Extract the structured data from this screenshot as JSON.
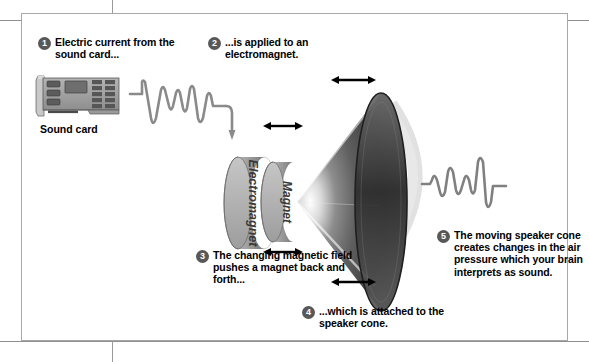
{
  "figure": {
    "frame_color": "#a8a8a8",
    "badge_color": "#585858",
    "wave_color": "#808080"
  },
  "callouts": [
    {
      "number": "1",
      "text": "Electric current from the sound card..."
    },
    {
      "number": "2",
      "text": "...is applied to an electromagnet."
    },
    {
      "number": "3",
      "text": "The changing magnetic field pushes a magnet back and forth..."
    },
    {
      "number": "4",
      "text": "...which is attached to the speaker cone."
    },
    {
      "number": "5",
      "text": "The moving speaker cone creates changes in the air pressure which your brain interprets as sound."
    }
  ],
  "parts": {
    "sound_card_label": "Sound card",
    "electromagnet_label": "Electromagnet",
    "magnet_label": "Magnet"
  },
  "icons": {
    "sound_card": "sound-card-icon",
    "signal_wave": "waveform-icon",
    "flow_arrow": "arrow-down-icon",
    "motion_arrow": "double-headed-arrow-icon",
    "speaker_cone": "speaker-cone-icon",
    "sound_waves": "sound-wave-arc-icon"
  }
}
